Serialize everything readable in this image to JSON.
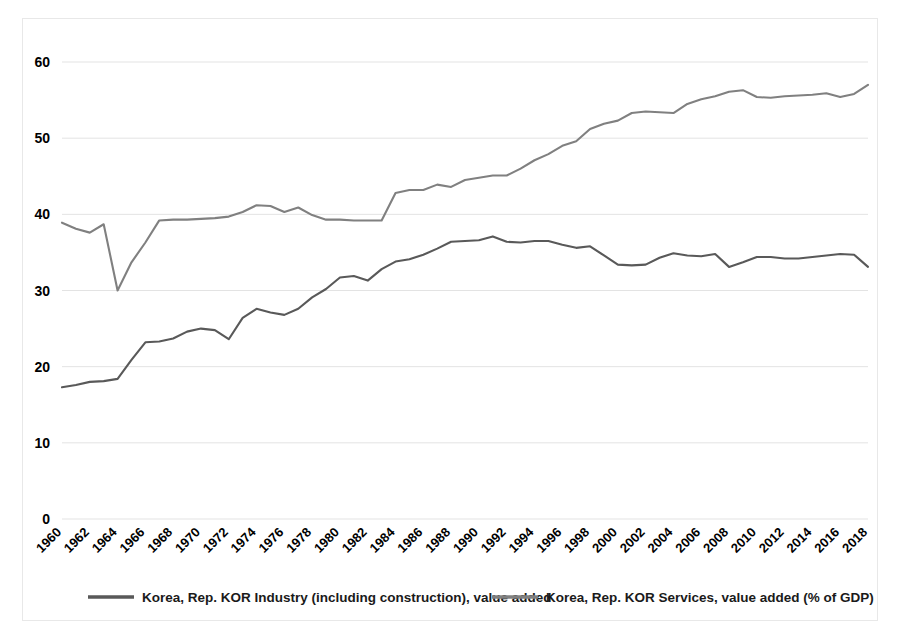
{
  "chart_data": {
    "type": "line",
    "title": "",
    "xlabel": "",
    "ylabel": "",
    "xlim": [
      1960,
      2018
    ],
    "ylim": [
      0,
      60
    ],
    "grid": true,
    "legend_position": "bottom",
    "y_ticks": [
      0,
      10,
      20,
      30,
      40,
      50,
      60
    ],
    "x_ticks": [
      1960,
      1962,
      1964,
      1966,
      1968,
      1970,
      1972,
      1974,
      1976,
      1978,
      1980,
      1982,
      1984,
      1986,
      1988,
      1990,
      1992,
      1994,
      1996,
      1998,
      2000,
      2002,
      2004,
      2006,
      2008,
      2010,
      2012,
      2014,
      2016,
      2018
    ],
    "x": [
      1960,
      1961,
      1962,
      1963,
      1964,
      1965,
      1966,
      1967,
      1968,
      1969,
      1970,
      1971,
      1972,
      1973,
      1974,
      1975,
      1976,
      1977,
      1978,
      1979,
      1980,
      1981,
      1982,
      1983,
      1984,
      1985,
      1986,
      1987,
      1988,
      1989,
      1990,
      1991,
      1992,
      1993,
      1994,
      1995,
      1996,
      1997,
      1998,
      1999,
      2000,
      2001,
      2002,
      2003,
      2004,
      2005,
      2006,
      2007,
      2008,
      2009,
      2010,
      2011,
      2012,
      2013,
      2014,
      2015,
      2016,
      2017,
      2018
    ],
    "series": [
      {
        "name": "Korea, Rep. KOR Industry (including construction), value added",
        "color": "#595959",
        "values": [
          17.3,
          17.6,
          18.0,
          18.1,
          18.4,
          20.9,
          23.2,
          23.3,
          23.7,
          24.6,
          25.0,
          24.8,
          23.6,
          26.4,
          27.6,
          27.1,
          26.8,
          27.6,
          29.1,
          30.2,
          31.7,
          31.9,
          31.3,
          32.8,
          33.8,
          34.1,
          34.7,
          35.5,
          36.4,
          36.5,
          36.6,
          37.1,
          36.4,
          36.3,
          36.5,
          36.5,
          36.0,
          35.6,
          35.8,
          34.6,
          33.4,
          33.3,
          33.4,
          34.3,
          34.9,
          34.6,
          34.5,
          34.8,
          33.1,
          33.7,
          34.4,
          34.4,
          34.2,
          34.2,
          34.4,
          34.6,
          34.8,
          34.7,
          33.1
        ]
      },
      {
        "name": "Korea, Rep. KOR Services, value added (% of GDP)",
        "color": "#808080",
        "values": [
          38.9,
          38.1,
          37.6,
          38.7,
          30.0,
          33.7,
          36.3,
          39.2,
          39.3,
          39.3,
          39.4,
          39.5,
          39.7,
          40.3,
          41.2,
          41.1,
          40.3,
          40.9,
          39.9,
          39.3,
          39.3,
          39.2,
          39.2,
          39.2,
          42.8,
          43.2,
          43.2,
          43.9,
          43.6,
          44.5,
          44.8,
          45.1,
          45.1,
          46.0,
          47.1,
          47.9,
          49.0,
          49.6,
          51.2,
          51.9,
          52.3,
          53.3,
          53.5,
          53.4,
          53.3,
          54.5,
          55.1,
          55.5,
          56.1,
          56.3,
          55.4,
          55.3,
          55.5,
          55.6,
          55.7,
          55.9,
          55.4,
          55.8,
          57.0
        ]
      }
    ]
  },
  "legend": {
    "entries": [
      {
        "label": "Korea, Rep. KOR Industry (including construction), value added"
      },
      {
        "label": "Korea, Rep. KOR Services, value added (% of GDP)"
      }
    ]
  }
}
